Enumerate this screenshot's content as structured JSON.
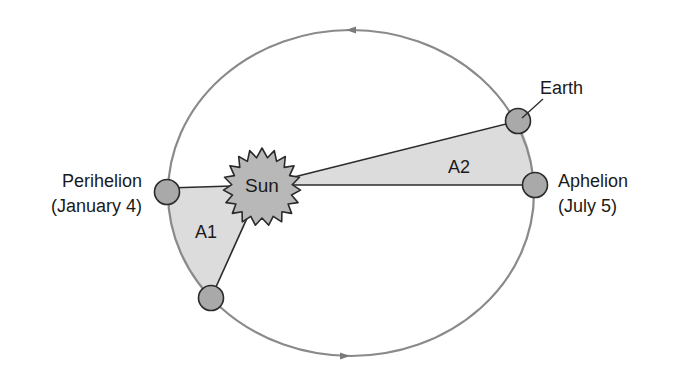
{
  "diagram": {
    "labels": {
      "perihelion": "Perihelion",
      "perihelion_date": "(January 4)",
      "aphelion": "Aphelion",
      "aphelion_date": "(July 5)",
      "earth": "Earth",
      "sun": "Sun",
      "area1": "A1",
      "area2": "A2"
    },
    "colors": {
      "orbit": "#8a8a8a",
      "area_fill": "#dcdcdc",
      "planet_fill": "#a9a9a9",
      "sun_fill": "#b8b8b8",
      "outline": "#2a2a2a"
    },
    "orbit_direction": "counterclockwise"
  }
}
